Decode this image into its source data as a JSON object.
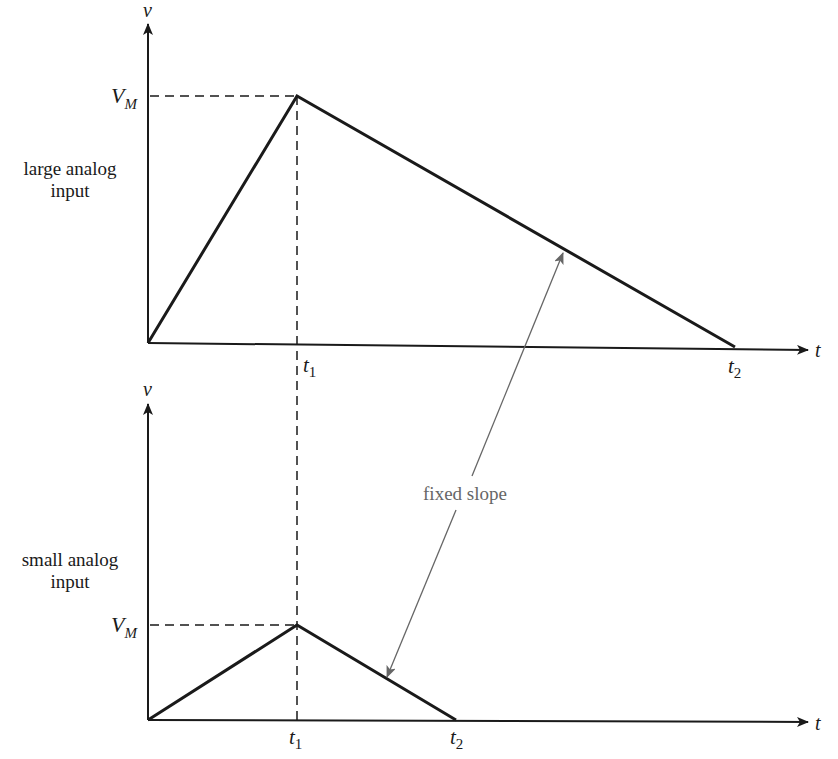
{
  "diagram": {
    "type": "waveform-comparison",
    "colors": {
      "line": "#1a1a1a",
      "annotation": "#666666",
      "background": "#ffffff"
    },
    "top_panel": {
      "label_line1": "large analog",
      "label_line2": "input",
      "y_axis_label": "v",
      "x_axis_label": "t",
      "peak_label_main": "V",
      "peak_label_sub": "M",
      "t1_main": "t",
      "t1_sub": "1",
      "t2_main": "t",
      "t2_sub": "2"
    },
    "bottom_panel": {
      "label_line1": "small analog",
      "label_line2": "input",
      "y_axis_label": "v",
      "x_axis_label": "t",
      "peak_label_main": "V",
      "peak_label_sub": "M",
      "t1_main": "t",
      "t1_sub": "1",
      "t2_main": "t",
      "t2_sub": "2"
    },
    "annotation": {
      "text": "fixed slope"
    }
  }
}
